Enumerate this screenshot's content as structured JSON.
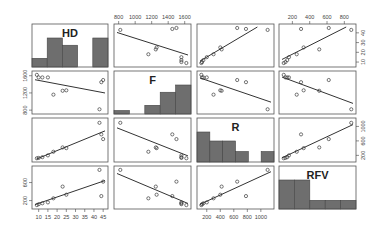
{
  "chart_data": {
    "type": "scatter",
    "subtype": "scatterplot-matrix",
    "title": "",
    "variables": [
      "HD",
      "F",
      "R",
      "RFV"
    ],
    "diagonal": "histogram",
    "off_diagonal": "scatter with linear regression line",
    "axes": {
      "HD": {
        "ticks": [
          10,
          15,
          20,
          25,
          30,
          35,
          40,
          45
        ],
        "range": [
          8,
          46
        ]
      },
      "F": {
        "ticks": [
          800,
          1000,
          1200,
          1400,
          1600
        ],
        "range": [
          780,
          1640
        ]
      },
      "R": {
        "ticks": [
          200,
          400,
          600,
          800,
          1000
        ],
        "range": [
          100,
          1150
        ]
      },
      "RFV": {
        "ticks": [
          200,
          400,
          600,
          800
        ],
        "range": [
          80,
          900
        ]
      }
    },
    "axis_labels_shown": {
      "top": [
        {
          "var": "F",
          "ticks": [
            "800",
            "1000",
            "1200",
            "1400",
            "1600"
          ]
        },
        {
          "var": "RFV",
          "ticks": [
            "200",
            "400",
            "600",
            "800"
          ]
        }
      ],
      "right": [
        {
          "var": "HD",
          "ticks": [
            "10",
            "20",
            "30",
            "40"
          ]
        },
        {
          "var": "R",
          "ticks": [
            "200",
            "600",
            "1000"
          ]
        }
      ],
      "left": [
        {
          "var": "F",
          "ticks": [
            "800",
            "1200",
            "1600"
          ]
        },
        {
          "var": "RFV",
          "ticks": [
            "200",
            "600"
          ]
        }
      ],
      "bottom": [
        {
          "var": "HD",
          "ticks": [
            "10",
            "15",
            "20",
            "25",
            "30",
            "35",
            "40",
            "45"
          ]
        },
        {
          "var": "R",
          "ticks": [
            "200",
            "400",
            "600",
            "800",
            "1000"
          ]
        }
      ]
    },
    "histograms": {
      "HD": [
        0.3,
        1.0,
        0.75,
        0.0,
        1.0
      ],
      "F": [
        0.12,
        0.0,
        0.3,
        0.75,
        1.0
      ],
      "R": [
        1.0,
        0.7,
        0.7,
        0.35,
        0.0,
        0.35
      ],
      "RFV": [
        1.0,
        1.0,
        0.3,
        0.3,
        0.3
      ]
    },
    "observations": [
      {
        "HD": 9,
        "F": 1620,
        "R": 120,
        "RFV": 100
      },
      {
        "HD": 10,
        "F": 1560,
        "R": 130,
        "RFV": 120
      },
      {
        "HD": 12,
        "F": 1560,
        "R": 150,
        "RFV": 140
      },
      {
        "HD": 15,
        "F": 1560,
        "R": 200,
        "RFV": 160
      },
      {
        "HD": 18,
        "F": 1160,
        "R": 300,
        "RFV": 250
      },
      {
        "HD": 23,
        "F": 1250,
        "R": 420,
        "RFV": 510
      },
      {
        "HD": 25,
        "F": 1260,
        "R": 400,
        "RFV": 330
      },
      {
        "HD": 43,
        "F": 820,
        "R": 1100,
        "RFV": 880
      },
      {
        "HD": 44,
        "F": 1450,
        "R": 780,
        "RFV": 300
      },
      {
        "HD": 45,
        "F": 1500,
        "R": 650,
        "RFV": 620
      }
    ],
    "grid": false,
    "legend": "none"
  }
}
